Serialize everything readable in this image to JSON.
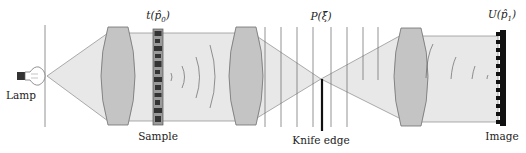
{
  "diagram": {
    "colors": {
      "beam": "#e6e6e6",
      "beam_edge": "#8a8a8a",
      "lens_fill": "#c4c4c4",
      "lens_edge": "#707070",
      "line": "#555555",
      "solid": "#111111"
    },
    "components": [
      {
        "id": "lamp",
        "label": "Lamp",
        "x": 33
      },
      {
        "id": "lens-1",
        "label": "",
        "x": 118
      },
      {
        "id": "sample",
        "label": "Sample",
        "top_label": "t(p̂₀)",
        "x": 157
      },
      {
        "id": "lens-2",
        "label": "",
        "x": 246
      },
      {
        "id": "knife-edge",
        "label": "Knife edge",
        "top_label": "P(ξ̂)",
        "x": 321
      },
      {
        "id": "lens-3",
        "label": "",
        "x": 411
      },
      {
        "id": "image",
        "label": "Image",
        "top_label": "U(p̂₁)",
        "x": 500
      }
    ],
    "labels": {
      "lamp": "Lamp",
      "sample": "Sample",
      "knife_edge": "Knife edge",
      "image": "Image",
      "sample_function": "t(p̂",
      "sample_sub": "0",
      "pupil_function": "P(ξ̂)",
      "image_function": "U(p̂",
      "image_sub": "1"
    },
    "vertical_planes_x": [
      265,
      281,
      297,
      313,
      331,
      347,
      363,
      378
    ]
  }
}
